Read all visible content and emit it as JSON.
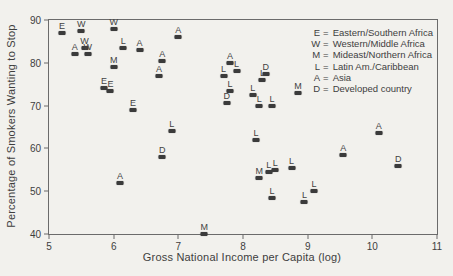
{
  "figure": {
    "background_color": "#f2f1ed",
    "ink_color": "#3e3e3e",
    "axis_color": "#6b6b6b",
    "marker_color": "#3b3b3b"
  },
  "chart_data": {
    "type": "scatter",
    "title": "",
    "xlabel": "Gross National Income per Capita (log)",
    "ylabel": "Percentage of Smokers Wanting to Stop",
    "xlim": [
      5,
      11
    ],
    "ylim": [
      40,
      90
    ],
    "x_ticks": [
      5,
      6,
      7,
      8,
      9,
      10,
      11
    ],
    "y_ticks": [
      40,
      50,
      60,
      70,
      80,
      90
    ],
    "grid": false,
    "legend_position": "top-right-inside",
    "legend_eq": "=",
    "legend": [
      {
        "letter": "E",
        "label": "Eastern/Southern Africa"
      },
      {
        "letter": "W",
        "label": "Western/Middle Africa"
      },
      {
        "letter": "M",
        "label": "Mideast/Northern Africa"
      },
      {
        "letter": "L",
        "label": "Latin Am./Caribbean"
      },
      {
        "letter": "A",
        "label": "Asia"
      },
      {
        "letter": "D",
        "label": "Developed country"
      }
    ],
    "marker_style": "letter label above small filled rectangle",
    "points": [
      {
        "letter": "E",
        "x": 5.2,
        "y": 87
      },
      {
        "letter": "W",
        "x": 5.5,
        "y": 87.5
      },
      {
        "letter": "W",
        "x": 5.55,
        "y": 83.5
      },
      {
        "letter": "A",
        "x": 5.4,
        "y": 82
      },
      {
        "letter": "W",
        "x": 5.6,
        "y": 82
      },
      {
        "letter": "W",
        "x": 6.0,
        "y": 88
      },
      {
        "letter": "M",
        "x": 6.0,
        "y": 79
      },
      {
        "letter": "E",
        "x": 5.85,
        "y": 74
      },
      {
        "letter": "E",
        "x": 5.95,
        "y": 73.5
      },
      {
        "letter": "L",
        "x": 6.15,
        "y": 83.5
      },
      {
        "letter": "A",
        "x": 6.4,
        "y": 83
      },
      {
        "letter": "E",
        "x": 6.3,
        "y": 69
      },
      {
        "letter": "A",
        "x": 7.0,
        "y": 86
      },
      {
        "letter": "A",
        "x": 6.75,
        "y": 80.5
      },
      {
        "letter": "A",
        "x": 6.7,
        "y": 77
      },
      {
        "letter": "L",
        "x": 6.9,
        "y": 64
      },
      {
        "letter": "A",
        "x": 6.1,
        "y": 52
      },
      {
        "letter": "D",
        "x": 6.75,
        "y": 58
      },
      {
        "letter": "M",
        "x": 7.4,
        "y": 40
      },
      {
        "letter": "A",
        "x": 7.8,
        "y": 80
      },
      {
        "letter": "L",
        "x": 7.7,
        "y": 77
      },
      {
        "letter": "L",
        "x": 7.9,
        "y": 78
      },
      {
        "letter": "D",
        "x": 8.35,
        "y": 77.5
      },
      {
        "letter": "L",
        "x": 8.3,
        "y": 76
      },
      {
        "letter": "L",
        "x": 7.8,
        "y": 73.5
      },
      {
        "letter": "L",
        "x": 8.15,
        "y": 72.5
      },
      {
        "letter": "D",
        "x": 7.75,
        "y": 70.5
      },
      {
        "letter": "L",
        "x": 8.25,
        "y": 70
      },
      {
        "letter": "L",
        "x": 8.45,
        "y": 70
      },
      {
        "letter": "M",
        "x": 8.85,
        "y": 73
      },
      {
        "letter": "L",
        "x": 8.2,
        "y": 62
      },
      {
        "letter": "L",
        "x": 8.4,
        "y": 54.5
      },
      {
        "letter": "L",
        "x": 8.5,
        "y": 55
      },
      {
        "letter": "L",
        "x": 8.75,
        "y": 55.5
      },
      {
        "letter": "M",
        "x": 8.25,
        "y": 53
      },
      {
        "letter": "L",
        "x": 8.45,
        "y": 48.5
      },
      {
        "letter": "L",
        "x": 9.1,
        "y": 50
      },
      {
        "letter": "L",
        "x": 8.95,
        "y": 47.5
      },
      {
        "letter": "A",
        "x": 9.55,
        "y": 58.5
      },
      {
        "letter": "A",
        "x": 10.1,
        "y": 63.5
      },
      {
        "letter": "D",
        "x": 10.4,
        "y": 56
      }
    ]
  }
}
